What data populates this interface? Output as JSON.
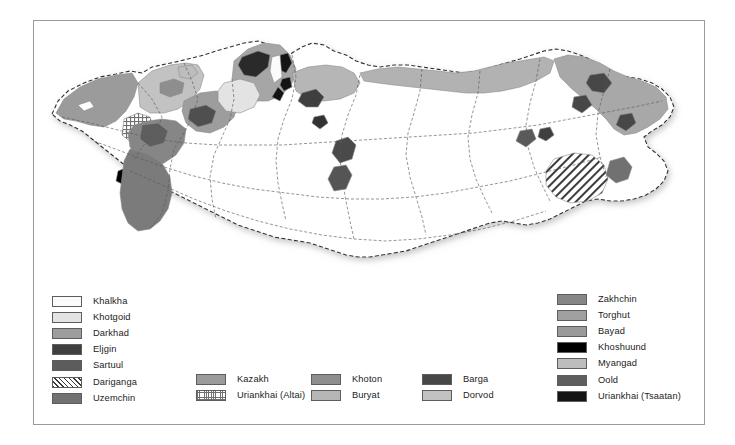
{
  "figure": {
    "frame_color": "#9a9a9a",
    "background": "#ffffff"
  },
  "map": {
    "name": "mongolia-ethnic-map",
    "country": "Mongolia",
    "internal_border_style": "dashed-thin-gray",
    "outer_border_style": "dashed-dark",
    "base_fill": "#ffffff"
  },
  "legend": {
    "columns": [
      {
        "id": "legend-left",
        "items": [
          {
            "label": "Khalkha",
            "color": "#fbfbfb",
            "pattern": "solid"
          },
          {
            "label": "Khotgoid",
            "color": "#e3e3e3",
            "pattern": "solid"
          },
          {
            "label": "Darkhad",
            "color": "#9d9d9d",
            "pattern": "solid"
          },
          {
            "label": "Eljgin",
            "color": "#3f3f3f",
            "pattern": "solid"
          },
          {
            "label": "Sartuul",
            "color": "#5c5c5c",
            "pattern": "solid"
          },
          {
            "label": "Dariganga",
            "color": "#ffffff",
            "pattern": "diagonal-hatch"
          },
          {
            "label": "Uzemchin",
            "color": "#717171",
            "pattern": "solid"
          }
        ]
      },
      {
        "id": "legend-mid1",
        "items": [
          {
            "label": "Kazakh",
            "color": "#9b9b9b",
            "pattern": "solid"
          },
          {
            "label": "Uriankhai (Altai)",
            "color": "#ffffff",
            "pattern": "grid-dots"
          }
        ]
      },
      {
        "id": "legend-mid2",
        "items": [
          {
            "label": "Khoton",
            "color": "#8e8e8e",
            "pattern": "solid"
          },
          {
            "label": "Buryat",
            "color": "#b6b6b6",
            "pattern": "solid"
          }
        ]
      },
      {
        "id": "legend-mid3",
        "items": [
          {
            "label": "Barga",
            "color": "#474747",
            "pattern": "solid"
          },
          {
            "label": "Dorvod",
            "color": "#c2c2c2",
            "pattern": "solid"
          }
        ]
      },
      {
        "id": "legend-right",
        "items": [
          {
            "label": "Zakhchin",
            "color": "#868686",
            "pattern": "solid"
          },
          {
            "label": "Torghut",
            "color": "#a0a0a0",
            "pattern": "solid"
          },
          {
            "label": "Bayad",
            "color": "#9a9a9a",
            "pattern": "solid"
          },
          {
            "label": "Khoshuund",
            "color": "#000000",
            "pattern": "solid"
          },
          {
            "label": "Myangad",
            "color": "#bdbdbd",
            "pattern": "solid"
          },
          {
            "label": "Oold",
            "color": "#5e5e5e",
            "pattern": "solid"
          },
          {
            "label": "Uriankhai (Tsaatan)",
            "color": "#141414",
            "pattern": "solid"
          }
        ]
      }
    ]
  }
}
